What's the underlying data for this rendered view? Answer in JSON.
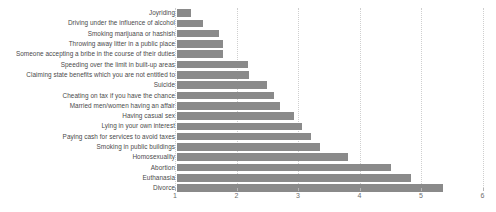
{
  "chart_data": {
    "type": "bar",
    "orientation": "horizontal",
    "title": "",
    "subtitle": "",
    "xlabel": "",
    "ylabel": "",
    "xlim": [
      1,
      6
    ],
    "ylim": null,
    "grid": true,
    "grid_axis": "x",
    "legend": false,
    "legend_position": "none",
    "bar_color": "#8a8a8a",
    "background_color": "#ffffff",
    "gridline_color": "#cfcfcf",
    "tick_label_color": "#6d6d6d",
    "category_label_color": "#4a4a4a",
    "xticks": [
      1,
      2,
      3,
      4,
      5,
      6
    ],
    "xtick_labels": [
      "1",
      "2",
      "3",
      "4",
      "5",
      "6"
    ],
    "categories": [
      "Joyriding",
      "Driving under the influence of alcohol",
      "Smoking marijuana or hashish",
      "Throwing away litter in a public place",
      "Someone accepting a bribe in the course of their duties",
      "Speeding over the limit in built-up areas",
      "Claiming state benefits which you are not entitled to",
      "Suicide",
      "Cheating on tax if you have the chance",
      "Married men/women having an affair",
      "Having casual sex",
      "Lying in your own interest",
      "Paying cash for services to avoid taxes",
      "Smoking in public buildings",
      "Homosexuality",
      "Abortion",
      "Euthanasia",
      "Divorce"
    ],
    "values": [
      1.26,
      1.46,
      1.71,
      1.78,
      1.78,
      2.19,
      2.2,
      2.5,
      2.61,
      2.71,
      2.93,
      3.07,
      3.21,
      3.36,
      3.81,
      4.51,
      4.84,
      5.36
    ]
  }
}
